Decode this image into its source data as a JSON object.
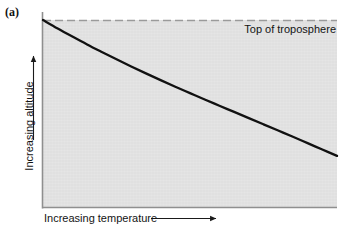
{
  "figure": {
    "panel_label": "(a)",
    "background_color": "#ffffff",
    "plot_fill_color": "#e2e2e2",
    "line_color": "#111111",
    "axis_color": "#8a8a8a"
  },
  "annotations": {
    "tropopause_label": "Top of troposphere"
  },
  "axes": {
    "x_caption": "Increasing temperature",
    "y_caption": "Increasing altitude",
    "x_arrow_icon": "right-arrow-icon",
    "y_arrow_icon": "up-arrow-icon"
  },
  "chart_data": {
    "type": "line",
    "title": "",
    "subtitle": "",
    "xlabel": "Increasing temperature",
    "ylabel": "Increasing altitude",
    "xlim": [
      0,
      1
    ],
    "ylim": [
      0,
      1
    ],
    "grid": false,
    "legend": false,
    "legend_position": "none",
    "axis_tick_labels": {
      "x": [],
      "y": []
    },
    "annotations": [
      {
        "text": "Top of troposphere",
        "type": "dashed-horizontal-line",
        "y": 1.0,
        "label_position": "top-right",
        "line_style": "dashed"
      }
    ],
    "series": [
      {
        "name": "Temperature profile in troposphere",
        "style": "solid",
        "color": "#111111",
        "x": [
          0.0,
          0.05,
          0.1,
          0.15,
          0.2,
          0.25,
          0.3,
          0.35,
          0.4,
          0.45,
          0.5,
          0.55,
          0.6,
          0.65,
          0.7,
          0.75,
          0.8,
          0.85,
          0.9,
          0.95,
          1.0
        ],
        "y": [
          1.0,
          0.955,
          0.912,
          0.87,
          0.83,
          0.791,
          0.753,
          0.716,
          0.68,
          0.645,
          0.611,
          0.577,
          0.544,
          0.511,
          0.478,
          0.445,
          0.412,
          0.379,
          0.345,
          0.311,
          0.277
        ]
      }
    ]
  }
}
